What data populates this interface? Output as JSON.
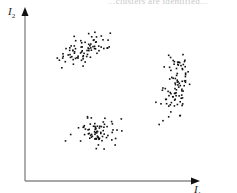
{
  "header": {
    "partial_text": "...clusters are identified..."
  },
  "chart_data": {
    "type": "scatter",
    "title": "",
    "xlabel": "I1",
    "ylabel": "I2",
    "xlabel_display": {
      "main": "I",
      "sub": "1"
    },
    "ylabel_display": {
      "main": "I",
      "sub": "2"
    },
    "grid": false,
    "legend": null,
    "axes": {
      "ticks": false,
      "arrows": true
    },
    "series": [
      {
        "name": "cluster-upper-left",
        "shape": "elongated, tilted upward to the right",
        "center": [
          0.3,
          0.8
        ],
        "points": 80
      },
      {
        "name": "cluster-right",
        "shape": "elongated vertically",
        "center": [
          0.82,
          0.5
        ],
        "points": 90
      },
      {
        "name": "cluster-bottom",
        "shape": "compact round",
        "center": [
          0.35,
          0.28
        ],
        "points": 75
      }
    ],
    "pixel_layout": {
      "origin": [
        25,
        181
      ],
      "x_end": [
        198,
        181
      ],
      "y_end": [
        25,
        8
      ],
      "clusters": [
        {
          "cx": 84,
          "cy": 48,
          "sx": 14,
          "sy": 6,
          "rot": -25,
          "n": 80
        },
        {
          "cx": 175,
          "cy": 85,
          "sx": 7,
          "sy": 19,
          "rot": 12,
          "n": 90
        },
        {
          "cx": 96,
          "cy": 132,
          "sx": 9,
          "sy": 7,
          "rot": 0,
          "n": 75
        }
      ]
    }
  },
  "colors": {
    "axis": "#8a8a8a",
    "arrow": "#111111",
    "point": "#111111",
    "label": "#222222"
  }
}
